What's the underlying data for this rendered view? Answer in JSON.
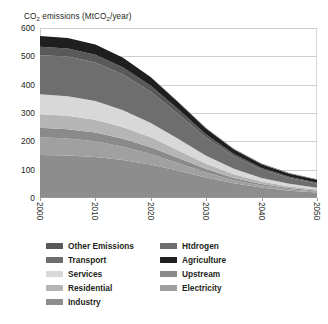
{
  "chart_data": {
    "type": "area",
    "title": "CO2 emissions (MtCO2/year)",
    "title_main": "CO",
    "title_sub1": "2",
    "title_mid": " emissions (MtCO",
    "title_sub2": "2",
    "title_end": "/year)",
    "xlabel": "",
    "ylabel": "",
    "stacked": true,
    "grid": true,
    "legend_position": "bottom",
    "xlim": [
      2000,
      2050
    ],
    "ylim": [
      0,
      600
    ],
    "yticks": [
      0,
      100,
      200,
      300,
      400,
      500,
      600
    ],
    "xticks": [
      2000,
      2010,
      2020,
      2030,
      2040,
      2050
    ],
    "x": [
      2000,
      2005,
      2010,
      2015,
      2020,
      2025,
      2030,
      2035,
      2040,
      2045,
      2050
    ],
    "series": [
      {
        "name": "Industry",
        "color": "#8d8d8d",
        "values": [
          152,
          150,
          145,
          134,
          118,
          96,
          72,
          52,
          37,
          26,
          19
        ]
      },
      {
        "name": "Electricity",
        "color": "#a0a0a0",
        "values": [
          62,
          60,
          55,
          47,
          37,
          27,
          18,
          11,
          7,
          5,
          4
        ]
      },
      {
        "name": "Upstream",
        "color": "#8a8a8a",
        "values": [
          34,
          33,
          31,
          28,
          24,
          18,
          12,
          8,
          5,
          4,
          3
        ]
      },
      {
        "name": "Residential",
        "color": "#b5b5b5",
        "values": [
          48,
          47,
          45,
          41,
          35,
          27,
          19,
          13,
          9,
          6,
          4
        ]
      },
      {
        "name": "Services",
        "color": "#d8d8d8",
        "values": [
          70,
          69,
          66,
          60,
          51,
          40,
          28,
          19,
          13,
          9,
          6
        ]
      },
      {
        "name": "Transport",
        "color": "#6e6e6e",
        "values": [
          138,
          140,
          136,
          126,
          110,
          88,
          64,
          44,
          30,
          21,
          15
        ]
      },
      {
        "name": "Other Emissions",
        "color": "#595959",
        "values": [
          30,
          29,
          28,
          25,
          21,
          16,
          11,
          8,
          5,
          4,
          3
        ]
      },
      {
        "name": "Agriculture",
        "color": "#1f1f1f",
        "values": [
          38,
          37,
          36,
          34,
          30,
          25,
          20,
          16,
          13,
          11,
          10
        ]
      },
      {
        "name": "Htdrogen",
        "color": "#6e6e6e",
        "values": [
          0,
          0,
          0,
          0,
          1,
          2,
          3,
          3,
          3,
          2,
          2
        ]
      }
    ],
    "totals": [
      572,
      565,
      542,
      495,
      427,
      339,
      247,
      174,
      122,
      88,
      66
    ]
  },
  "legend": {
    "columns": [
      {
        "items": [
          {
            "label": "Other Emissions",
            "color": "#595959"
          },
          {
            "label": "Transport",
            "color": "#6e6e6e"
          },
          {
            "label": "Services",
            "color": "#d8d8d8"
          },
          {
            "label": "Residential",
            "color": "#b5b5b5"
          },
          {
            "label": "Industry",
            "color": "#8d8d8d"
          }
        ]
      },
      {
        "items": [
          {
            "label": "Htdrogen",
            "color": "#6e6e6e"
          },
          {
            "label": "Agriculture",
            "color": "#1f1f1f"
          },
          {
            "label": "Upstream",
            "color": "#8a8a8a"
          },
          {
            "label": "Electricity",
            "color": "#a0a0a0"
          }
        ]
      }
    ]
  }
}
